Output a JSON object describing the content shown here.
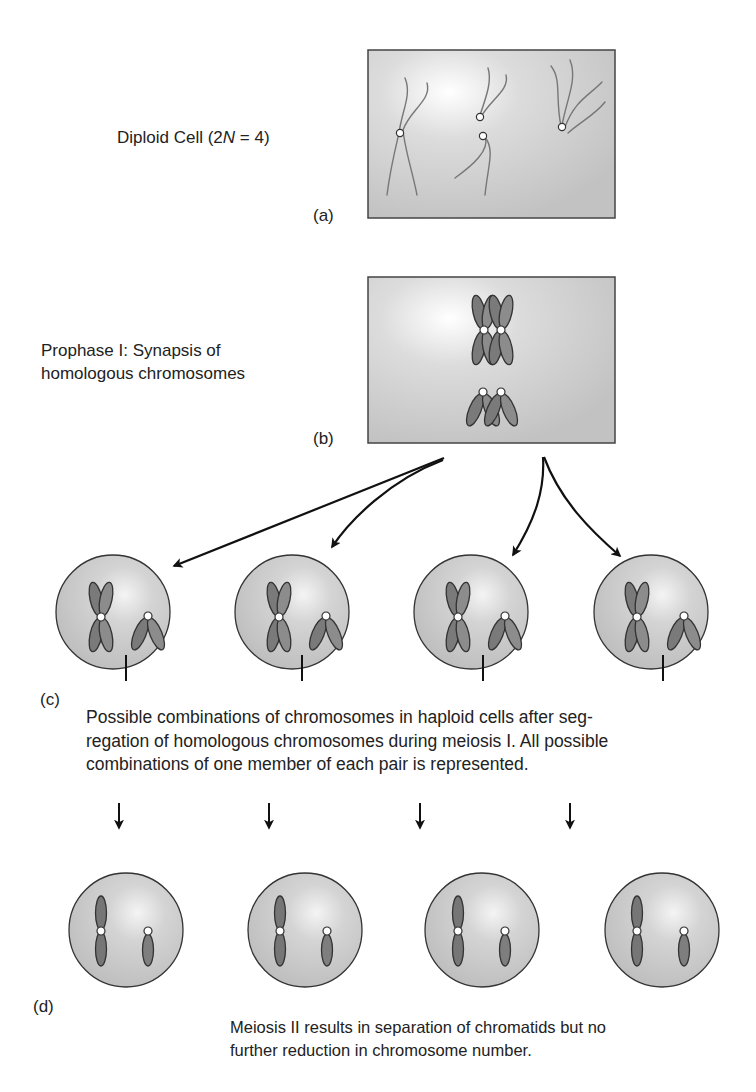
{
  "panels": {
    "a": {
      "tag": "(a)",
      "label_prefix": "Diploid Cell (2",
      "label_italic": "N",
      "label_suffix": " = 4)"
    },
    "b": {
      "tag": "(b)",
      "label_line1": "Prophase I: Synapsis of",
      "label_line2": "homologous chromosomes"
    },
    "c": {
      "tag": "(c)",
      "caption_line1": "Possible combinations of chromosomes in haploid cells after seg-",
      "caption_line2": "regation of homologous chromosomes during meiosis I. All possible",
      "caption_line3": "combinations of one member of each pair is represented.",
      "cell_count": 4
    },
    "d": {
      "tag": "(d)",
      "caption_line1": "Meiosis II results in separation of chromatids but no",
      "caption_line2": "further reduction in chromosome number.",
      "cell_count": 4
    }
  },
  "colors": {
    "box_fill": "#c8c8c8",
    "cell_fill": "#c4c4c4",
    "chromosome_dark": "#6e6e6e",
    "chromosome_light": "#8e8e8e",
    "outline": "#333333",
    "centromere": "#ffffff"
  }
}
